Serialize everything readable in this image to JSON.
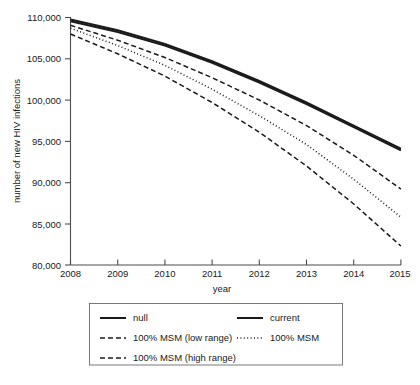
{
  "chart_data": {
    "type": "line",
    "title": "",
    "xlabel": "year",
    "ylabel": "number of new HIV infections",
    "x": [
      2008,
      2009,
      2010,
      2011,
      2012,
      2013,
      2014,
      2015
    ],
    "xlim": [
      2008,
      2015
    ],
    "ylim": [
      80000,
      110000
    ],
    "ytick_labels": [
      "110,000",
      "105,000",
      "100,000",
      "95,000",
      "90,000",
      "85,000",
      "80,000"
    ],
    "ytick_values": [
      110000,
      105000,
      100000,
      95000,
      90000,
      85000,
      80000
    ],
    "xtick_labels": [
      "2008",
      "2009",
      "2010",
      "2011",
      "2012",
      "2013",
      "2014",
      "2015"
    ],
    "grid": false,
    "legend_position": "below-plot",
    "series": [
      {
        "name": "null",
        "style": "solid",
        "values": [
          109750,
          108450,
          106800,
          104700,
          102300,
          99700,
          96900,
          94100
        ]
      },
      {
        "name": "current",
        "style": "solid",
        "values": [
          109550,
          108250,
          106600,
          104500,
          102100,
          99500,
          96700,
          93900
        ]
      },
      {
        "name": "100% MSM (low range)",
        "style": "dashed",
        "values": [
          109050,
          107250,
          105150,
          102700,
          100000,
          96900,
          93300,
          89200
        ]
      },
      {
        "name": "100% MSM",
        "style": "dotted",
        "values": [
          108700,
          106600,
          104200,
          101300,
          98100,
          94600,
          90400,
          85800
        ]
      },
      {
        "name": "100% MSM (high range)",
        "style": "dashed",
        "values": [
          108000,
          105600,
          102900,
          99700,
          96100,
          92000,
          87400,
          82300
        ]
      }
    ]
  },
  "axes": {
    "ylabel": "number of new HIV infections",
    "xlabel": "year",
    "yticks": [
      "110,000",
      "105,000",
      "100,000",
      "95,000",
      "90,000",
      "85,000",
      "80,000"
    ],
    "xticks": [
      "2008",
      "2009",
      "2010",
      "2011",
      "2012",
      "2013",
      "2014",
      "2015"
    ]
  },
  "legend": {
    "entries": [
      {
        "label": "null",
        "style": "solid",
        "column": 0,
        "row": 0
      },
      {
        "label": "current",
        "style": "solid",
        "column": 1,
        "row": 0
      },
      {
        "label": "100% MSM (low range)",
        "style": "dashed",
        "column": 0,
        "row": 1
      },
      {
        "label": "100% MSM",
        "style": "dotted",
        "column": 1,
        "row": 1
      },
      {
        "label": "100% MSM (high range)",
        "style": "dashed",
        "column": 0,
        "row": 2
      }
    ]
  },
  "colors": {
    "series_line": "#1a1a1a",
    "axis": "#4d4d4d",
    "legend_border": "#6b6b6b",
    "background": "#ffffff"
  }
}
